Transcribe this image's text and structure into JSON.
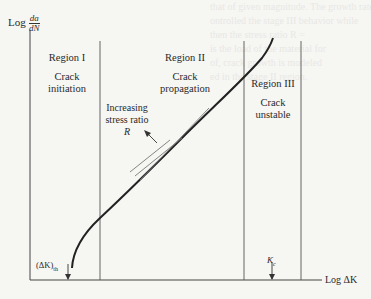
{
  "figure": {
    "y_axis_label": "Log",
    "y_axis_fraction_num": "da",
    "y_axis_fraction_den": "dN",
    "x_axis_label": "Log ΔK",
    "regions": [
      {
        "title": "Region I",
        "desc_line1": "Crack",
        "desc_line2": "initiation"
      },
      {
        "title": "Region II",
        "desc_line1": "Crack",
        "desc_line2": "propagation"
      },
      {
        "title": "Region III",
        "desc_line1": "Crack",
        "desc_line2": "unstable"
      }
    ],
    "annotation": {
      "line1": "Increasing",
      "line2": "stress ratio",
      "line3": "R"
    },
    "threshold_label": "(ΔK)th",
    "threshold_label_main": "(ΔK)",
    "threshold_label_sub": "th",
    "critical_label_main": "K",
    "critical_label_sub": "c"
  },
  "background_text": [
    "that of given magnitude. The growth rate",
    "ontrolled the stage III behavior while",
    "then the stress ratio R =",
    "is the load of the material for",
    "of, crack growth is modeled",
    "ed in the stage II region."
  ]
}
